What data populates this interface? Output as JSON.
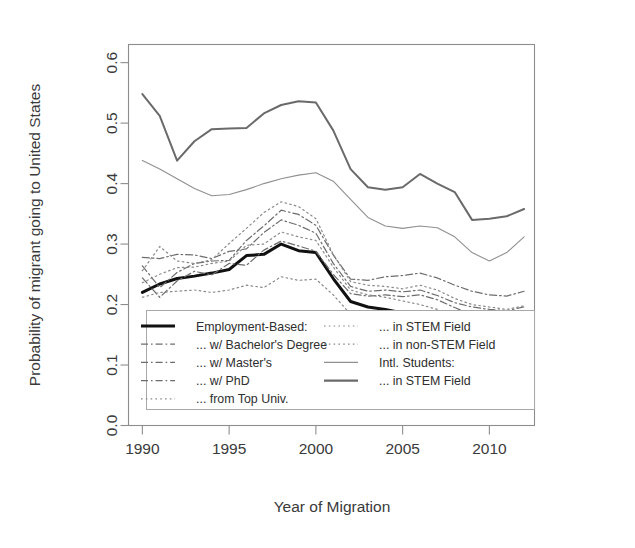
{
  "figure": {
    "background": "#ffffff",
    "frame_color": "#8d8d8d"
  },
  "chart_data": {
    "type": "line",
    "title": "",
    "xlabel": "Year of Migration",
    "ylabel": "Probability of migrant going to United States",
    "xlim": [
      1989.2,
      2012.6
    ],
    "ylim": [
      0.0,
      0.63
    ],
    "xticks": [
      1990,
      1995,
      2000,
      2005,
      2010
    ],
    "xtick_labels": [
      "1990",
      "1995",
      "2000",
      "2005",
      "2010"
    ],
    "yticks": [
      0.0,
      0.1,
      0.2,
      0.3,
      0.4,
      0.5,
      0.6
    ],
    "ytick_labels": [
      "0.0",
      "0.1",
      "0.2",
      "0.3",
      "0.4",
      "0.5",
      "0.6"
    ],
    "grid": false,
    "legend_position": "bottom-center-inside",
    "x": [
      1990,
      1991,
      1992,
      1993,
      1994,
      1995,
      1996,
      1997,
      1998,
      1999,
      2000,
      2001,
      2002,
      2003,
      2004,
      2005,
      2006,
      2007,
      2008,
      2009,
      2010,
      2011,
      2012
    ],
    "series": [
      {
        "name": "Employment-Based:",
        "key": "employment_based",
        "style": "solid",
        "width": 3.0,
        "color": "#111111",
        "values": [
          0.22,
          0.234,
          0.243,
          0.247,
          0.252,
          0.258,
          0.281,
          0.283,
          0.3,
          0.289,
          0.286,
          0.243,
          0.205,
          0.196,
          0.192,
          0.186,
          0.178,
          0.17,
          0.16,
          0.152,
          0.146,
          0.14,
          0.138
        ]
      },
      {
        "name": "... w/ Bachelor's Degree",
        "key": "bachelors",
        "style": "dashdot",
        "width": 1.2,
        "color": "#6d6d6d",
        "values": [
          0.244,
          0.212,
          0.239,
          0.255,
          0.249,
          0.268,
          0.265,
          0.29,
          0.305,
          0.297,
          0.288,
          0.25,
          0.218,
          0.214,
          0.216,
          0.213,
          0.216,
          0.208,
          0.195,
          0.183,
          0.178,
          0.176,
          0.182
        ]
      },
      {
        "name": "... w/ Master's",
        "key": "masters",
        "style": "dashdot",
        "width": 1.2,
        "color": "#6d6d6d",
        "values": [
          0.278,
          0.276,
          0.283,
          0.282,
          0.276,
          0.288,
          0.292,
          0.319,
          0.34,
          0.331,
          0.318,
          0.268,
          0.23,
          0.222,
          0.224,
          0.221,
          0.224,
          0.215,
          0.203,
          0.196,
          0.192,
          0.19,
          0.196
        ]
      },
      {
        "name": "... w/ PhD",
        "key": "phd",
        "style": "dashdot",
        "width": 1.2,
        "color": "#6d6d6d",
        "values": [
          0.264,
          0.228,
          0.253,
          0.268,
          0.272,
          0.273,
          0.306,
          0.33,
          0.356,
          0.349,
          0.331,
          0.282,
          0.242,
          0.24,
          0.246,
          0.248,
          0.252,
          0.244,
          0.232,
          0.222,
          0.216,
          0.214,
          0.222
        ]
      },
      {
        "name": "... from Top Univ.",
        "key": "top_univ",
        "style": "dotted",
        "width": 1.2,
        "color": "#8a8a8a",
        "values": [
          0.256,
          0.296,
          0.272,
          0.268,
          0.274,
          0.301,
          0.326,
          0.352,
          0.37,
          0.362,
          0.342,
          0.283,
          0.238,
          0.232,
          0.23,
          0.226,
          0.232,
          0.224,
          0.21,
          0.2,
          0.196,
          0.192,
          0.198
        ]
      },
      {
        "name": "... in STEM Field",
        "key": "eb_stem",
        "style": "dotted",
        "width": 1.2,
        "color": "#8a8a8a",
        "values": [
          0.236,
          0.25,
          0.261,
          0.262,
          0.268,
          0.272,
          0.298,
          0.3,
          0.32,
          0.312,
          0.306,
          0.262,
          0.224,
          0.216,
          0.212,
          0.206,
          0.2,
          0.192,
          0.18,
          0.172,
          0.166,
          0.16,
          0.16
        ]
      },
      {
        "name": "... in non-STEM Field",
        "key": "eb_non_stem",
        "style": "dotted",
        "width": 1.2,
        "color": "#8a8a8a",
        "values": [
          0.212,
          0.22,
          0.222,
          0.224,
          0.22,
          0.224,
          0.232,
          0.228,
          0.246,
          0.24,
          0.242,
          0.216,
          0.184,
          0.176,
          0.172,
          0.166,
          0.158,
          0.15,
          0.14,
          0.134,
          0.128,
          0.124,
          0.124
        ]
      },
      {
        "name": "Intl. Students:",
        "key": "intl_students",
        "style": "solid",
        "width": 1.1,
        "color": "#909090",
        "values": [
          0.438,
          0.424,
          0.408,
          0.392,
          0.38,
          0.382,
          0.39,
          0.4,
          0.408,
          0.414,
          0.418,
          0.404,
          0.374,
          0.344,
          0.33,
          0.326,
          0.33,
          0.327,
          0.312,
          0.286,
          0.272,
          0.286,
          0.312
        ]
      },
      {
        "name": "... in STEM Field",
        "key": "intl_stem",
        "style": "solid",
        "width": 2.0,
        "color": "#6a6a6a",
        "values": [
          0.548,
          0.512,
          0.438,
          0.47,
          0.49,
          0.491,
          0.492,
          0.516,
          0.53,
          0.536,
          0.534,
          0.488,
          0.424,
          0.394,
          0.39,
          0.394,
          0.416,
          0.4,
          0.386,
          0.34,
          0.342,
          0.346,
          0.358
        ]
      }
    ]
  },
  "legend": {
    "column_left": [
      {
        "label": "Employment-Based:",
        "style": "solid-thick"
      },
      {
        "label": "... w/ Bachelor's Degree",
        "style": "dashdot"
      },
      {
        "label": "... w/ Master's",
        "style": "dashdot"
      },
      {
        "label": "... w/ PhD",
        "style": "dashdot"
      },
      {
        "label": "... from Top Univ.",
        "style": "dotted"
      }
    ],
    "column_right": [
      {
        "label": "... in STEM Field",
        "style": "dotted"
      },
      {
        "label": "... in non-STEM Field",
        "style": "dotted"
      },
      {
        "label": "Intl. Students:",
        "style": "solid-thin"
      },
      {
        "label": "... in STEM Field",
        "style": "solid-medium"
      }
    ]
  }
}
